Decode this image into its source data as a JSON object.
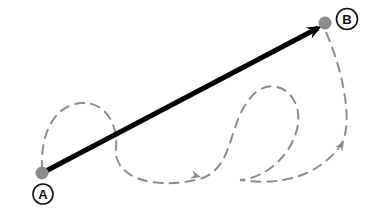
{
  "figure": {
    "width": 370,
    "height": 208,
    "background_color": "#ffffff"
  },
  "colors": {
    "direct_path": "#000000",
    "indirect_path": "#8c8c8c",
    "node_marker_fill": "#8c8c8c",
    "node_label_stroke": "#111111",
    "node_label_text": "#111111",
    "canvas": "#ffffff"
  },
  "nodes": [
    {
      "id": "A",
      "label": "A",
      "role": "start",
      "marker": {
        "x": 42,
        "y": 173,
        "r": 6.5
      },
      "label_circle": {
        "x": 43,
        "y": 194,
        "r": 10
      }
    },
    {
      "id": "B",
      "label": "B",
      "role": "end",
      "marker": {
        "x": 325,
        "y": 23,
        "r": 6.5
      },
      "label_circle": {
        "x": 347,
        "y": 19,
        "r": 10.5
      }
    }
  ],
  "paths": [
    {
      "id": "direct",
      "name": "direct-arrow",
      "style": "solid",
      "color": "#000000",
      "stroke_width": 5,
      "arrowheads": [
        "end"
      ],
      "from": "A",
      "to": "B",
      "d": "M 44 172 L 318 28"
    },
    {
      "id": "indirect",
      "name": "indirect-dashed-loop",
      "style": "dashed",
      "color": "#8c8c8c",
      "stroke_width": 2,
      "dash_pattern": "9 7",
      "arrowheads": [
        "mid-bottom",
        "mid-right"
      ],
      "from": "A",
      "to": "B",
      "d": "M 42 170 C 40 128 58 104 82 103 C 108 102 118 128 116 148 C 113 176 150 190 196 180 C 236 171 226 124 252 96 C 272 74 302 92 298 124 C 294 152 268 178 240 180 C 282 186 318 176 340 146 C 356 124 340 62 325 30"
    }
  ],
  "arrow_markers": [
    {
      "id": "direct-end-arrowhead",
      "x": 322,
      "y": 26,
      "angle": -28,
      "color": "#000000",
      "size": 15
    },
    {
      "id": "indirect-bottom-arrowhead",
      "x": 201,
      "y": 177,
      "angle": 14,
      "color": "#8c8c8c",
      "size": 10
    },
    {
      "id": "indirect-right-arrowhead",
      "x": 344,
      "y": 141,
      "angle": -58,
      "color": "#8c8c8c",
      "size": 10
    }
  ]
}
